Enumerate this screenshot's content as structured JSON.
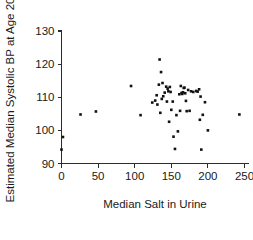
{
  "chart_data": {
    "type": "scatter",
    "title": "",
    "xlabel": "Median Salt in Urine",
    "ylabel": "Estimated Median Systolic BP at Age 20",
    "xlim": [
      0,
      250
    ],
    "ylim": [
      90,
      130
    ],
    "xticks": [
      0,
      50,
      100,
      150,
      200,
      250
    ],
    "yticks": [
      90,
      100,
      110,
      120,
      130
    ],
    "xtick_labels": [
      "0",
      "50",
      "100",
      "150",
      "200",
      "250"
    ],
    "ytick_labels": [
      "90",
      "100",
      "110",
      "120",
      "130"
    ],
    "grid": false,
    "legend": false,
    "marker": "filled-square",
    "marker_color": "#111111",
    "marker_size": 2.6,
    "points": [
      [
        0,
        94.2
      ],
      [
        2,
        98.0
      ],
      [
        26,
        104.8
      ],
      [
        47,
        105.7
      ],
      [
        95,
        113.4
      ],
      [
        108,
        104.6
      ],
      [
        124,
        108.4
      ],
      [
        128,
        109.0
      ],
      [
        130,
        110.6
      ],
      [
        131,
        107.8
      ],
      [
        133,
        113.8
      ],
      [
        134,
        121.4
      ],
      [
        135,
        105.3
      ],
      [
        136,
        117.6
      ],
      [
        137,
        109.5
      ],
      [
        138,
        114.3
      ],
      [
        139,
        110.3
      ],
      [
        141,
        111.4
      ],
      [
        143,
        113.2
      ],
      [
        144,
        108.7
      ],
      [
        145,
        112.6
      ],
      [
        146,
        111.8
      ],
      [
        147,
        102.6
      ],
      [
        148,
        113.1
      ],
      [
        149,
        111.6
      ],
      [
        150,
        106.2
      ],
      [
        152,
        108.7
      ],
      [
        153,
        98.1
      ],
      [
        155,
        94.4
      ],
      [
        157,
        104.6
      ],
      [
        159,
        99.7
      ],
      [
        161,
        110.9
      ],
      [
        162,
        105.9
      ],
      [
        163,
        113.4
      ],
      [
        164,
        111.3
      ],
      [
        165,
        111.0
      ],
      [
        166,
        111.5
      ],
      [
        167,
        112.8
      ],
      [
        168,
        112.9
      ],
      [
        169,
        111.2
      ],
      [
        170,
        108.9
      ],
      [
        171,
        105.8
      ],
      [
        173,
        112.2
      ],
      [
        175,
        105.9
      ],
      [
        177,
        111.8
      ],
      [
        180,
        111.6
      ],
      [
        184,
        111.9
      ],
      [
        186,
        111.7
      ],
      [
        188,
        112.4
      ],
      [
        189,
        103.2
      ],
      [
        190,
        110.2
      ],
      [
        191,
        94.2
      ],
      [
        193,
        104.7
      ],
      [
        196,
        108.5
      ],
      [
        200,
        100.0
      ],
      [
        243,
        104.8
      ]
    ]
  },
  "axes": {
    "x_axis_name": "x-axis",
    "y_axis_name": "y-axis"
  }
}
